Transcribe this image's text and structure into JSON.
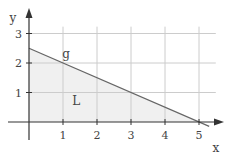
{
  "chart_data": {
    "type": "line",
    "title": "",
    "xlabel": "x",
    "ylabel": "y",
    "xlim": [
      0,
      5.6
    ],
    "ylim": [
      0,
      3.3
    ],
    "grid": true,
    "x_ticks": [
      "1",
      "2",
      "3",
      "4",
      "5"
    ],
    "y_ticks": [
      "1",
      "2",
      "3"
    ],
    "series": [
      {
        "name": "g",
        "x": [
          0,
          5
        ],
        "y": [
          2.5,
          0
        ],
        "equation": "y = -0.5x + 2.5"
      }
    ],
    "region": {
      "name": "L",
      "description": "shaded triangle bounded by axes and line g",
      "vertices": [
        [
          0,
          0
        ],
        [
          0,
          2.5
        ],
        [
          5,
          0
        ]
      ]
    },
    "annotations": [
      {
        "text": "g",
        "x": 1.0,
        "y": 2.3
      },
      {
        "text": "L",
        "x": 1.3,
        "y": 0.7
      }
    ]
  },
  "colors": {
    "axis": "#333333",
    "grid": "#cccccc",
    "line": "#666666",
    "fill": "#f0f0f0",
    "text": "#444444"
  }
}
